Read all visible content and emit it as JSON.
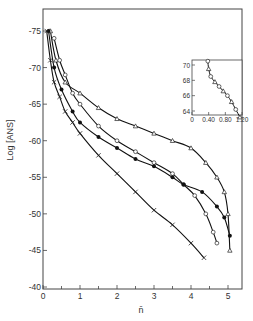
{
  "chart_data": [
    {
      "type": "line",
      "title": "",
      "xlabel": "n̄",
      "ylabel": "Log [ANS]",
      "xlim": [
        0,
        5.3
      ],
      "ylim": [
        -40,
        -77
      ],
      "x_ticks": [
        "0",
        "1",
        "2",
        "3",
        "4",
        "5"
      ],
      "y_ticks": [
        "-75",
        "-70",
        "-65",
        "-60",
        "-55",
        "-50",
        "-45",
        "-40"
      ],
      "grid": false,
      "series": [
        {
          "name": "triangles",
          "marker": "triangle",
          "x": [
            0.2,
            0.35,
            0.6,
            1.0,
            1.5,
            2.0,
            2.5,
            3.0,
            3.5,
            4.0,
            4.4,
            4.7,
            4.9,
            5.0,
            5.05
          ],
          "y": [
            -75,
            -71,
            -68,
            -66.5,
            -64.5,
            -63,
            -62,
            -61,
            -60,
            -59,
            -57,
            -55,
            -53,
            -50,
            -45
          ]
        },
        {
          "name": "open circles",
          "marker": "circle-open",
          "x": [
            0.3,
            0.45,
            0.6,
            0.8,
            1.0,
            1.5,
            2.0,
            2.5,
            3.0,
            3.5,
            3.8,
            4.1,
            4.4,
            4.6,
            4.7
          ],
          "y": [
            -74,
            -71,
            -69,
            -66.5,
            -65,
            -62,
            -60,
            -58.5,
            -57,
            -55.5,
            -54,
            -52.5,
            -50,
            -47.5,
            -46
          ]
        },
        {
          "name": "filled circles",
          "marker": "circle-filled",
          "x": [
            0.15,
            0.3,
            0.5,
            0.8,
            1.0,
            1.5,
            2.0,
            2.5,
            3.0,
            3.5,
            3.8,
            4.3,
            4.7,
            4.9,
            5.05
          ],
          "y": [
            -75,
            -70,
            -67,
            -64,
            -62.5,
            -60.5,
            -59,
            -57.5,
            -56.5,
            -55,
            -54,
            -53,
            -51,
            -49.5,
            -47
          ]
        },
        {
          "name": "crosses",
          "marker": "cross",
          "x": [
            0.1,
            0.2,
            0.3,
            0.45,
            0.6,
            0.8,
            1.0,
            1.5,
            2.0,
            2.5,
            3.0,
            3.5,
            4.0,
            4.35
          ],
          "y": [
            -75,
            -71,
            -68,
            -66,
            -64,
            -62.5,
            -61,
            -58,
            -55.5,
            -53,
            -50.5,
            -48.5,
            -46,
            -44
          ]
        }
      ]
    },
    {
      "type": "line",
      "title": "inset",
      "xlabel": "",
      "ylabel": "",
      "xlim": [
        0,
        1.2
      ],
      "ylim": [
        63,
        70.5
      ],
      "x_ticks": [
        "0",
        "0.40",
        "0.80",
        "1.20"
      ],
      "y_ticks": [
        "70",
        "68",
        "66",
        "64"
      ],
      "series": [
        {
          "name": "inset data",
          "marker": "mixed",
          "x": [
            0.38,
            0.4,
            0.45,
            0.55,
            0.65,
            0.75,
            0.85,
            0.95,
            1.05,
            1.15
          ],
          "y": [
            70.5,
            69.5,
            68.5,
            67.8,
            67.2,
            66.6,
            66.0,
            65.2,
            64.2,
            63.2
          ]
        }
      ]
    }
  ]
}
